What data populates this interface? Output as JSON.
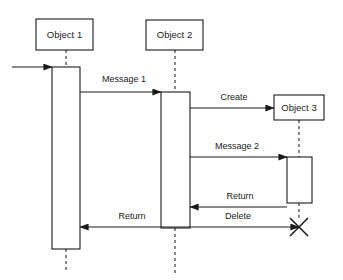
{
  "diagram": {
    "kind": "uml-sequence-diagram",
    "canvas": {
      "width": 343,
      "height": 280,
      "background": "#ffffff"
    },
    "stroke_color": "#1a1a1a",
    "lifeline_color": "#4a4a4a",
    "fill_color": "#ffffff"
  },
  "objects": [
    {
      "id": "object-1",
      "label": "Object 1",
      "box": {
        "x": 36,
        "y": 19,
        "w": 57,
        "h": 31
      },
      "lifeline_x": 66,
      "lifeline_segments": [
        {
          "y1": 50,
          "y2": 67
        },
        {
          "y1": 249,
          "y2": 273
        }
      ],
      "activation": {
        "x": 52,
        "y": 67,
        "w": 28,
        "h": 182
      }
    },
    {
      "id": "object-2",
      "label": "Object 2",
      "box": {
        "x": 146,
        "y": 20,
        "w": 57,
        "h": 30
      },
      "lifeline_x": 175,
      "lifeline_segments": [
        {
          "y1": 50,
          "y2": 92
        },
        {
          "y1": 228,
          "y2": 273
        }
      ],
      "activation": {
        "x": 161,
        "y": 92,
        "w": 29,
        "h": 136
      }
    },
    {
      "id": "object-3",
      "label": "Object 3",
      "box": {
        "x": 274,
        "y": 95,
        "w": 50,
        "h": 25
      },
      "lifeline_x": 299,
      "lifeline_segments": [
        {
          "y1": 120,
          "y2": 157
        },
        {
          "y1": 203,
          "y2": 221
        }
      ],
      "activation": {
        "x": 287,
        "y": 157,
        "w": 25,
        "h": 46
      }
    }
  ],
  "messages": [
    {
      "id": "found-message",
      "label": "",
      "from_x": 12,
      "to_x": 52,
      "y": 67,
      "direction": "right",
      "label_x": 0,
      "label_y": 0,
      "has_label": false
    },
    {
      "id": "message-1",
      "label": "Message 1",
      "from_x": 80,
      "to_x": 161,
      "y": 92,
      "direction": "right",
      "label_x": 124,
      "label_y": 80,
      "has_label": true
    },
    {
      "id": "create-message",
      "label": "Create",
      "from_x": 190,
      "to_x": 274,
      "y": 108,
      "direction": "right",
      "label_x": 234,
      "label_y": 98,
      "has_label": true
    },
    {
      "id": "message-2",
      "label": "Message 2",
      "from_x": 190,
      "to_x": 287,
      "y": 157,
      "direction": "right",
      "label_x": 237,
      "label_y": 147,
      "has_label": true
    },
    {
      "id": "return-from-object-3",
      "label": "Return",
      "from_x": 287,
      "to_x": 190,
      "y": 207,
      "direction": "left",
      "label_x": 240,
      "label_y": 197,
      "has_label": true
    },
    {
      "id": "delete-message",
      "label": "Delete",
      "from_x": 190,
      "to_x": 299,
      "y": 227,
      "direction": "right",
      "label_x": 238,
      "label_y": 217,
      "has_label": true
    },
    {
      "id": "return-to-object-1",
      "label": "Return",
      "from_x": 190,
      "to_x": 80,
      "y": 227,
      "direction": "left",
      "label_x": 132,
      "label_y": 217,
      "has_label": true
    }
  ],
  "destruction": {
    "id": "destroy-object-3",
    "label": "destruction-x",
    "cx": 299,
    "cy": 227,
    "radius": 9
  }
}
